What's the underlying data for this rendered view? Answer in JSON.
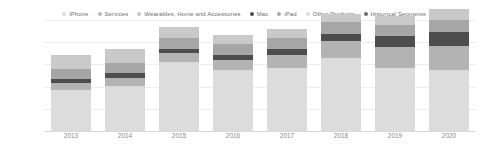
{
  "chart_data": {
    "type": "bar",
    "title": "",
    "subtitle": "",
    "xlabel": "",
    "ylabel": "",
    "stacked": true,
    "grid": true,
    "legend_position": "top",
    "categories": [
      "2013",
      "2014",
      "2015",
      "2016",
      "2017",
      "2018",
      "2019",
      "2020"
    ],
    "ylim": [
      0,
      250000
    ],
    "ytick_values": [
      0,
      50000,
      100000,
      150000,
      200000,
      250000
    ],
    "ytick_labels": [
      "0",
      "50k",
      "100k",
      "150k",
      "200k",
      "250k"
    ],
    "unit_note": "",
    "series": [
      {
        "name": "iPhone",
        "color": "#dcdcdc",
        "values": [
          91279,
          101991,
          155041,
          136700,
          141319,
          164888,
          142381,
          137781
        ]
      },
      {
        "name": "Services",
        "color": "#b3b3b3",
        "values": [
          16051,
          18063,
          19909,
          24348,
          29980,
          37190,
          46291,
          53768
        ]
      },
      {
        "name": "Wearables, Home and Accessories",
        "color": "#4d4d4d",
        "values": [
          10117,
          10067,
          10067,
          11132,
          12826,
          17381,
          24482,
          30620
        ]
      },
      {
        "name": "Mac",
        "color": "#a6a6a6",
        "values": [
          21483,
          24079,
          25471,
          22831,
          25850,
          25484,
          25740,
          28622
        ]
      },
      {
        "name": "iPad",
        "color": "#c9c9c9",
        "values": [
          31980,
          30283,
          23227,
          20628,
          19222,
          18805,
          21280,
          23724
        ]
      },
      {
        "name": "Other Products",
        "color": "#dedede",
        "values": [
          0,
          0,
          0,
          0,
          0,
          0,
          0,
          0
        ]
      },
      {
        "name": "Historical Segments",
        "color": "#8c8c8c",
        "values": [
          0,
          0,
          0,
          0,
          0,
          0,
          0,
          0
        ]
      }
    ]
  },
  "legend": {
    "items": [
      {
        "label": "iPhone",
        "color": "#dcdcdc"
      },
      {
        "label": "Services",
        "color": "#b8b8b8"
      },
      {
        "label": "Wearables, Home and Accessories",
        "color": "#c9c9c9"
      },
      {
        "label": "Mac",
        "color": "#4d4d4d"
      },
      {
        "label": "iPad",
        "color": "#a6a6a6"
      },
      {
        "label": "Other Products",
        "color": "#dedede"
      },
      {
        "label": "Historical Segments",
        "color": "#6b6b6b"
      }
    ]
  },
  "axes": {
    "y": {
      "labels": [
        "250k",
        "200k",
        "150k",
        "100k",
        "50k",
        "0"
      ]
    },
    "x": {
      "labels": [
        "2013",
        "2014",
        "2015",
        "2016",
        "2017",
        "2018",
        "2019",
        "2020"
      ]
    }
  }
}
